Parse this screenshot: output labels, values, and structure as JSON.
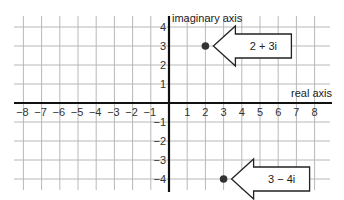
{
  "diagram": {
    "axes": {
      "real_label": "real axis",
      "imaginary_label": "imaginary axis",
      "real_ticks": [
        -8,
        -7,
        -6,
        -5,
        -4,
        -3,
        -2,
        -1,
        1,
        2,
        3,
        4,
        5,
        6,
        7,
        8
      ],
      "imaginary_ticks": [
        4,
        3,
        2,
        1,
        -1,
        -2,
        -3,
        -4
      ]
    },
    "points": [
      {
        "label": "2 + 3i",
        "re": 2,
        "im": 3
      },
      {
        "label": "3 − 4i",
        "re": 3,
        "im": -4
      }
    ],
    "colors": {
      "grid": "#b8b8b8",
      "axis": "#111111",
      "point": "#333333",
      "callout_border": "#222222"
    }
  }
}
